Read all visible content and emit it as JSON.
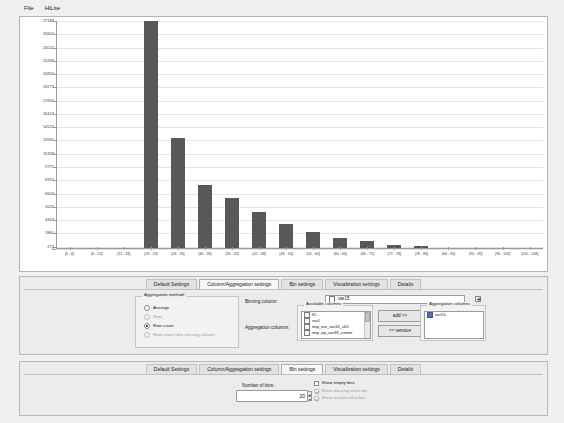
{
  "menu": {
    "items": [
      {
        "label": "File"
      },
      {
        "label": "HiLite"
      }
    ]
  },
  "chart_data": {
    "type": "bar",
    "title": "",
    "xlabel": "",
    "ylabel": "",
    "ylim": [
      0,
      27188
    ],
    "grid": true,
    "legend": false,
    "ytick_labels": [
      "27188",
      "25605",
      "24022",
      "22439",
      "20856",
      "19273",
      "17690",
      "16107",
      "14524",
      "12941",
      "11358",
      "9775",
      "8192",
      "6609",
      "5026",
      "3443",
      "1860",
      "277",
      "0"
    ],
    "ytick_values": [
      27188,
      25605,
      24022,
      22439,
      20856,
      19273,
      17690,
      16107,
      14524,
      12941,
      11358,
      9775,
      8192,
      6609,
      5026,
      3443,
      1860,
      277,
      0
    ],
    "categories": [
      "[0 - 6]",
      "(6 - 12]",
      "(12 - 18]",
      "(18 - 24]",
      "(24 - 30]",
      "(30 - 36]",
      "(36 - 42]",
      "(42 - 48]",
      "(48 - 54]",
      "(54 - 60]",
      "(60 - 66]",
      "(66 - 72]",
      "(72 - 78]",
      "(78 - 84]",
      "(84 - 90]",
      "(90 - 96]",
      "(96 - 102]",
      "(102 - 108]"
    ],
    "values": [
      170,
      150,
      160,
      27188,
      13200,
      7600,
      6100,
      4400,
      3000,
      2000,
      1300,
      900,
      520,
      300,
      180,
      140,
      120,
      90
    ]
  },
  "middle_panel": {
    "tabs": [
      {
        "label": "Default Settings",
        "active": false
      },
      {
        "label": "Column/Aggregation settings",
        "active": true
      },
      {
        "label": "Bin settings",
        "active": false
      },
      {
        "label": "Visualization settings",
        "active": false
      },
      {
        "label": "Details",
        "active": false
      }
    ],
    "aggregation_method": {
      "title": "Aggregation method:",
      "options": [
        {
          "label": "Average",
          "selected": false,
          "enabled": true
        },
        {
          "label": "Sum",
          "selected": false,
          "enabled": false
        },
        {
          "label": "Row count",
          "selected": true,
          "enabled": true
        },
        {
          "label": "Row count (w/o missing values)",
          "selected": false,
          "enabled": false
        }
      ]
    },
    "binning_column": {
      "label": "Binning column:",
      "value": "var15"
    },
    "aggregation_columns_label": "Aggregation columns:",
    "available_columns": {
      "title": "Available columns",
      "items": [
        {
          "label": "ID",
          "icon": "integer-icon"
        },
        {
          "label": "var1",
          "icon": "integer-icon"
        },
        {
          "label": "imp_am_var16_ult1",
          "icon": "double-icon"
        },
        {
          "label": "imp_op_var39_comer",
          "icon": "double-icon"
        }
      ]
    },
    "buttons": {
      "add": "add >>",
      "remove": "<< remove"
    },
    "selected_columns": {
      "title": "Aggregation columns",
      "items": [
        {
          "label": "var15",
          "icon": "blue-square-icon"
        }
      ]
    }
  },
  "bottom_panel": {
    "tabs": [
      {
        "label": "Default Settings",
        "active": false
      },
      {
        "label": "Column/Aggregation settings",
        "active": false
      },
      {
        "label": "Bin settings",
        "active": true
      },
      {
        "label": "Visualization settings",
        "active": false
      },
      {
        "label": "Details",
        "active": false
      }
    ],
    "number_of_bins": {
      "label": "Number of bins:",
      "value": "20"
    },
    "checkboxes": [
      {
        "label": "Show empty bins",
        "checked": false,
        "enabled": true
      },
      {
        "label": "Show missing value bin",
        "checked": true,
        "enabled": false
      },
      {
        "label": "Show invalid value bin",
        "checked": true,
        "enabled": false
      }
    ]
  }
}
